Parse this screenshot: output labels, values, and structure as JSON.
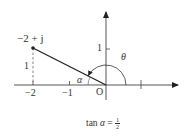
{
  "diagram": {
    "type": "complex-plane-argument",
    "point": {
      "label": "−2 + j",
      "re": -2,
      "im": 1
    },
    "axes": {
      "x_ticks": [
        {
          "value": -2,
          "label": "−2"
        },
        {
          "value": -1,
          "label": "−1"
        },
        {
          "value": 1,
          "label": "1"
        }
      ],
      "y_ticks": [
        {
          "value": 1,
          "label": "1"
        }
      ],
      "origin_label": "O"
    },
    "vertical_leg_label": "1",
    "angles": {
      "alpha": "α",
      "theta": "θ"
    },
    "caption": {
      "prefix": "tan ",
      "symbol": "α",
      "equals": " = ",
      "numerator": "1",
      "denominator": "2"
    },
    "colors": {
      "line": "#222222",
      "axis": "#444444",
      "dashed": "#666666"
    }
  }
}
